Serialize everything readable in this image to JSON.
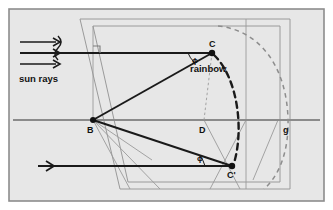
{
  "figure": {
    "background_color": "#e6e6e6",
    "border_color": "#8a8a8a",
    "line_color": "#1a1a1a",
    "thin_line_color": "#9a9a9a",
    "dash_color": "#6f6f6f"
  },
  "labels": {
    "sun_rays": "sun rays",
    "rainbow": "rainbow",
    "point_b": "B",
    "point_c": "C",
    "point_c_prime": "C'",
    "point_d": "D",
    "point_g": "g",
    "angle_phi_top": "ϕ",
    "angle_phi_bottom": "ϕ"
  },
  "elements": {
    "incoming_rays_count": 3,
    "right_angle_marker": "right-angle",
    "rainbow_arc_style": "thick-dashed",
    "outer_arc_style": "thin-dashed",
    "sight_line_style": "dotted"
  }
}
